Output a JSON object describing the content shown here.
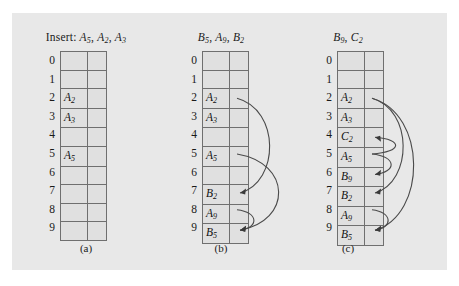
{
  "figure": {
    "background_color": "#e8e8e8",
    "panels": [
      {
        "id": "a",
        "caption": "(a)",
        "header_prefix": "Insert: ",
        "header_keys": [
          {
            "base": "A",
            "sub": "5"
          },
          {
            "base": "A",
            "sub": "2"
          },
          {
            "base": "A",
            "sub": "3"
          }
        ],
        "slots": [
          {
            "index": "0",
            "base": "",
            "sub": ""
          },
          {
            "index": "1",
            "base": "",
            "sub": ""
          },
          {
            "index": "2",
            "base": "A",
            "sub": "2"
          },
          {
            "index": "3",
            "base": "A",
            "sub": "3"
          },
          {
            "index": "4",
            "base": "",
            "sub": ""
          },
          {
            "index": "5",
            "base": "A",
            "sub": "5"
          },
          {
            "index": "6",
            "base": "",
            "sub": ""
          },
          {
            "index": "7",
            "base": "",
            "sub": ""
          },
          {
            "index": "8",
            "base": "",
            "sub": ""
          },
          {
            "index": "9",
            "base": "",
            "sub": ""
          }
        ],
        "probe_arrows": []
      },
      {
        "id": "b",
        "caption": "(b)",
        "header_prefix": "",
        "header_keys": [
          {
            "base": "B",
            "sub": "5"
          },
          {
            "base": "A",
            "sub": "9"
          },
          {
            "base": "B",
            "sub": "2"
          }
        ],
        "slots": [
          {
            "index": "0",
            "base": "",
            "sub": ""
          },
          {
            "index": "1",
            "base": "",
            "sub": ""
          },
          {
            "index": "2",
            "base": "A",
            "sub": "2"
          },
          {
            "index": "3",
            "base": "A",
            "sub": "3"
          },
          {
            "index": "4",
            "base": "",
            "sub": ""
          },
          {
            "index": "5",
            "base": "A",
            "sub": "5"
          },
          {
            "index": "6",
            "base": "",
            "sub": ""
          },
          {
            "index": "7",
            "base": "B",
            "sub": "2"
          },
          {
            "index": "8",
            "base": "A",
            "sub": "9"
          },
          {
            "index": "9",
            "base": "B",
            "sub": "5"
          }
        ],
        "probe_arrows": [
          {
            "from_slot": "5",
            "to_slot": "9",
            "bulge": 46
          },
          {
            "from_slot": "2",
            "to_slot": "7",
            "bulge": 34
          },
          {
            "from_slot": "8",
            "to_slot": "9",
            "bulge": 13
          }
        ]
      },
      {
        "id": "c",
        "caption": "(c)",
        "header_prefix": "",
        "header_keys": [
          {
            "base": "B",
            "sub": "9"
          },
          {
            "base": "C",
            "sub": "2"
          }
        ],
        "slots": [
          {
            "index": "0",
            "base": "",
            "sub": ""
          },
          {
            "index": "1",
            "base": "",
            "sub": ""
          },
          {
            "index": "2",
            "base": "A",
            "sub": "2"
          },
          {
            "index": "3",
            "base": "A",
            "sub": "3"
          },
          {
            "index": "4",
            "base": "C",
            "sub": "2"
          },
          {
            "index": "5",
            "base": "A",
            "sub": "5"
          },
          {
            "index": "6",
            "base": "B",
            "sub": "9"
          },
          {
            "index": "7",
            "base": "B",
            "sub": "2"
          },
          {
            "index": "8",
            "base": "A",
            "sub": "9"
          },
          {
            "index": "9",
            "base": "B",
            "sub": "5"
          }
        ],
        "probe_arrows": [
          {
            "from_slot": "2",
            "to_slot": "9",
            "bulge": 46
          },
          {
            "from_slot": "2",
            "to_slot": "7",
            "bulge": 32
          },
          {
            "from_slot": "5",
            "to_slot": "6",
            "bulge": 16
          },
          {
            "from_slot": "5",
            "to_slot": "4",
            "bulge": 22
          },
          {
            "from_slot": "8",
            "to_slot": "9",
            "bulge": 12
          }
        ]
      }
    ]
  }
}
